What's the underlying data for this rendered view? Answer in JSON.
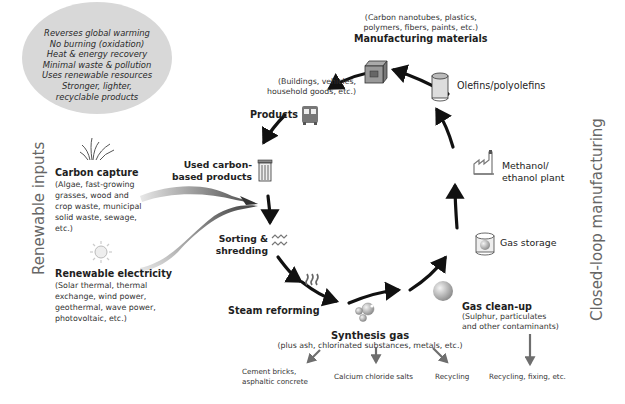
{
  "benefits": {
    "lines": [
      "Reverses global warming",
      "No burning (oxidation)",
      "Heat & energy recovery",
      "Minimal waste & pollution",
      "Uses renewable resources",
      "Stronger, lighter,",
      "recyclable products"
    ]
  },
  "side_labels": {
    "left": "Renewable inputs",
    "right": "Closed-loop manufacturing"
  },
  "inputs": {
    "carbon_capture": {
      "title": "Carbon capture",
      "detail": [
        "(Algae, fast-growing",
        "grasses, wood and",
        "crop waste, municipal",
        "solid waste, sewage,",
        "etc.)"
      ],
      "icon": "grass-icon"
    },
    "renewable_electricity": {
      "title": "Renewable electricity",
      "detail": [
        "(Solar thermal, thermal",
        "exchange, wind power,",
        "geothermal, wave power,",
        "photovoltaic, etc.)"
      ],
      "icon": "sun-icon"
    }
  },
  "cycle": {
    "manufacturing_materials": {
      "title": "Manufacturing materials",
      "detail": [
        "(Carbon nanotubes, plastics,",
        "polymers, fibers, paints, etc.)"
      ],
      "icon": "box-icon"
    },
    "products": {
      "title": "Products",
      "detail": [
        "(Buildings, vehicles,",
        "household goods, etc.)"
      ],
      "icon": "bus-icon"
    },
    "used_products": {
      "title": [
        "Used carbon-",
        "based products"
      ],
      "icon": "trash-bin-icon"
    },
    "sorting": {
      "title": [
        "Sorting &",
        "shredding"
      ],
      "icon": "zigzag-icon"
    },
    "steam_reforming": {
      "title": "Steam reforming",
      "icon": "steam-icon"
    },
    "synthesis_gas": {
      "title": "Synthesis gas",
      "detail": "(plus ash, chlorinated substances, metals, etc.)",
      "icon": "gas-bubbles-icon"
    },
    "gas_cleanup": {
      "title": "Gas clean-up",
      "detail": [
        "(Sulphur, particulates",
        "and other contaminants)"
      ],
      "icon": "sphere-icon"
    },
    "gas_storage": {
      "title": "Gas storage",
      "icon": "tank-icon"
    },
    "methanol_plant": {
      "title": [
        "Methanol/",
        "ethanol plant"
      ],
      "icon": "factory-icon"
    },
    "olefins": {
      "title": "Olefins/polyolefins",
      "icon": "cylinder-icon"
    }
  },
  "outputs": {
    "cement": [
      "Cement bricks,",
      "asphaltic concrete"
    ],
    "calcium": "Calcium chloride salts",
    "recycling": "Recycling",
    "recycling_fixing": "Recycling, fixing, etc."
  },
  "colors": {
    "arrow": "#111111",
    "output_arrow": "#6e6e6e",
    "bubble": "#d8d8d8",
    "text": "#222222",
    "side_label": "#666666"
  }
}
